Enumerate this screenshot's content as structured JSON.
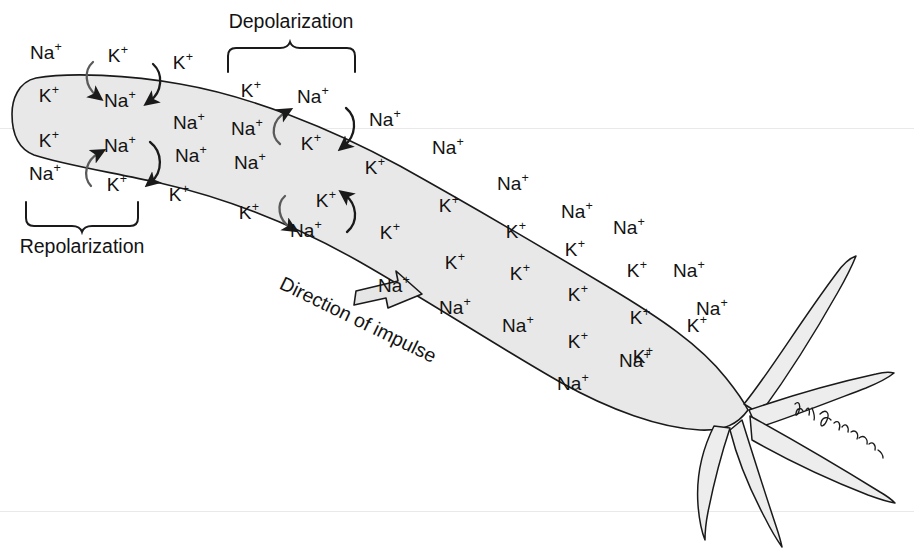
{
  "figure": {
    "background_color": "#ffffff",
    "ink_color": "#131313",
    "axon_fill_color": "#e8e8e8",
    "axon_stroke_color": "#1a1a1a",
    "arrow_fill_color": "#e6e6e6",
    "width": 914,
    "height": 548
  },
  "annotations": {
    "depolarization": "Depolarization",
    "repolarization": "Repolarization",
    "direction_of_impulse": "Direction of impulse",
    "signature": "artist-signature"
  },
  "ion_species": {
    "sodium": {
      "symbol": "Na",
      "charge": "+"
    },
    "potassium": {
      "symbol": "K",
      "charge": "+"
    }
  },
  "ions": [
    {
      "species": "Na",
      "charge": "+",
      "x": 46,
      "y": 52,
      "side": "outside"
    },
    {
      "species": "K",
      "charge": "+",
      "x": 118,
      "y": 55,
      "side": "outside"
    },
    {
      "species": "K",
      "charge": "+",
      "x": 183,
      "y": 62,
      "side": "outside"
    },
    {
      "species": "K",
      "charge": "+",
      "x": 49,
      "y": 95,
      "side": "inside"
    },
    {
      "species": "Na",
      "charge": "+",
      "x": 120,
      "y": 100,
      "side": "inside"
    },
    {
      "species": "K",
      "charge": "+",
      "x": 251,
      "y": 90,
      "side": "outside"
    },
    {
      "species": "Na",
      "charge": "+",
      "x": 189,
      "y": 122,
      "side": "inside"
    },
    {
      "species": "Na",
      "charge": "+",
      "x": 247,
      "y": 128,
      "side": "inside"
    },
    {
      "species": "Na",
      "charge": "+",
      "x": 313,
      "y": 96,
      "side": "outside"
    },
    {
      "species": "Na",
      "charge": "+",
      "x": 385,
      "y": 119,
      "side": "outside"
    },
    {
      "species": "K",
      "charge": "+",
      "x": 311,
      "y": 143,
      "side": "inside"
    },
    {
      "species": "K",
      "charge": "+",
      "x": 49,
      "y": 140,
      "side": "inside"
    },
    {
      "species": "Na",
      "charge": "+",
      "x": 120,
      "y": 145,
      "side": "inside"
    },
    {
      "species": "Na",
      "charge": "+",
      "x": 191,
      "y": 155,
      "side": "inside"
    },
    {
      "species": "Na",
      "charge": "+",
      "x": 250,
      "y": 162,
      "side": "inside"
    },
    {
      "species": "Na",
      "charge": "+",
      "x": 45,
      "y": 173,
      "side": "outside"
    },
    {
      "species": "K",
      "charge": "+",
      "x": 117,
      "y": 184,
      "side": "outside"
    },
    {
      "species": "K",
      "charge": "+",
      "x": 179,
      "y": 194,
      "side": "outside"
    },
    {
      "species": "Na",
      "charge": "+",
      "x": 448,
      "y": 147,
      "side": "outside"
    },
    {
      "species": "K",
      "charge": "+",
      "x": 375,
      "y": 167,
      "side": "inside"
    },
    {
      "species": "K",
      "charge": "+",
      "x": 326,
      "y": 200,
      "side": "inside"
    },
    {
      "species": "K",
      "charge": "+",
      "x": 249,
      "y": 212,
      "side": "outside"
    },
    {
      "species": "Na",
      "charge": "+",
      "x": 306,
      "y": 230,
      "side": "outside"
    },
    {
      "species": "K",
      "charge": "+",
      "x": 449,
      "y": 205,
      "side": "inside"
    },
    {
      "species": "K",
      "charge": "+",
      "x": 390,
      "y": 232,
      "side": "inside"
    },
    {
      "species": "Na",
      "charge": "+",
      "x": 513,
      "y": 183,
      "side": "outside"
    },
    {
      "species": "Na",
      "charge": "+",
      "x": 577,
      "y": 211,
      "side": "outside"
    },
    {
      "species": "K",
      "charge": "+",
      "x": 516,
      "y": 231,
      "side": "inside"
    },
    {
      "species": "K",
      "charge": "+",
      "x": 455,
      "y": 262,
      "side": "inside"
    },
    {
      "species": "Na",
      "charge": "+",
      "x": 394,
      "y": 285,
      "side": "outside"
    },
    {
      "species": "Na",
      "charge": "+",
      "x": 455,
      "y": 307,
      "side": "outside"
    },
    {
      "species": "K",
      "charge": "+",
      "x": 575,
      "y": 249,
      "side": "inside"
    },
    {
      "species": "K",
      "charge": "+",
      "x": 520,
      "y": 273,
      "side": "inside"
    },
    {
      "species": "Na",
      "charge": "+",
      "x": 629,
      "y": 227,
      "side": "outside"
    },
    {
      "species": "K",
      "charge": "+",
      "x": 637,
      "y": 270,
      "side": "inside"
    },
    {
      "species": "K",
      "charge": "+",
      "x": 578,
      "y": 294,
      "side": "inside"
    },
    {
      "species": "Na",
      "charge": "+",
      "x": 518,
      "y": 325,
      "side": "outside"
    },
    {
      "species": "Na",
      "charge": "+",
      "x": 689,
      "y": 270,
      "side": "outside"
    },
    {
      "species": "K",
      "charge": "+",
      "x": 640,
      "y": 317,
      "side": "inside"
    },
    {
      "species": "K",
      "charge": "+",
      "x": 578,
      "y": 341,
      "side": "inside"
    },
    {
      "species": "Na",
      "charge": "+",
      "x": 573,
      "y": 383,
      "side": "outside"
    },
    {
      "species": "Na",
      "charge": "+",
      "x": 635,
      "y": 360,
      "side": "outside"
    },
    {
      "species": "K",
      "charge": "+",
      "x": 697,
      "y": 325,
      "side": "inside"
    },
    {
      "species": "K",
      "charge": "+",
      "x": 643,
      "y": 356,
      "side": "inside"
    },
    {
      "species": "Na",
      "charge": "+",
      "x": 712,
      "y": 308,
      "side": "outside"
    }
  ],
  "exchange_sites": [
    {
      "id": "repol-top",
      "outward_ion": "K",
      "inward_ion": "Na",
      "region": "repolarization"
    },
    {
      "id": "repol-bottom",
      "outward_ion": "Na",
      "inward_ion": "K",
      "region": "repolarization"
    },
    {
      "id": "depol-top",
      "outward_ion": "Na",
      "inward_ion": "K",
      "region": "depolarization"
    },
    {
      "id": "depol-bottom",
      "outward_ion": "K",
      "inward_ion": "Na",
      "region": "depolarization"
    }
  ]
}
